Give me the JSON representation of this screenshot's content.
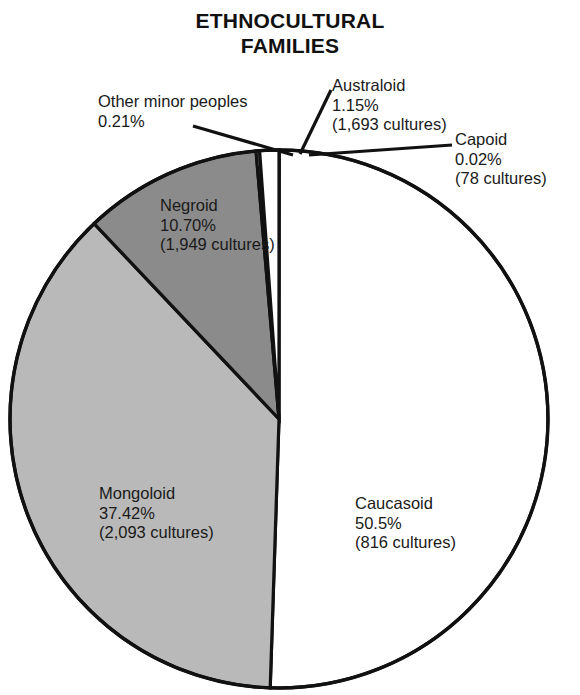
{
  "title": {
    "line1": "ETHNOCULTURAL",
    "line2": "FAMILIES"
  },
  "labels": {
    "other": {
      "name": "Other minor peoples",
      "percent": "0.21%",
      "count": ""
    },
    "australoid": {
      "name": "Australoid",
      "percent": "1.15%",
      "count": "(1,693 cultures)"
    },
    "capoid": {
      "name": "Capoid",
      "percent": "0.02%",
      "count": "(78 cultures)"
    },
    "negroid": {
      "name": "Negroid",
      "percent": "10.70%",
      "count": "(1,949 cultures)"
    },
    "mongoloid": {
      "name": "Mongoloid",
      "percent": "37.42%",
      "count": "(2,093 cultures)"
    },
    "caucasoid": {
      "name": "Caucasoid",
      "percent": "50.5%",
      "count": "(816 cultures)"
    }
  },
  "chart_data": {
    "type": "pie",
    "title": "ETHNOCULTURAL FAMILIES",
    "xlabel": "",
    "ylabel": "",
    "grid": false,
    "legend": "none (direct slice labels with leader lines)",
    "units": "percent of world population; culture counts in parentheses",
    "start_angle_deg": 0,
    "direction": "clockwise from 12 o'clock",
    "categories": [
      "Capoid",
      "Caucasoid",
      "Mongoloid",
      "Negroid",
      "Other minor peoples",
      "Australoid"
    ],
    "values": [
      0.02,
      50.5,
      37.42,
      10.7,
      0.21,
      1.15
    ],
    "counts": [
      78,
      816,
      2093,
      1949,
      null,
      1693
    ],
    "colors": [
      "#ffffff",
      "#ffffff",
      "#b9b9b9",
      "#8b8b8b",
      "#ffffff",
      "#ffffff"
    ],
    "slices": [
      {
        "label": "Capoid",
        "value": 0.02,
        "count": 78,
        "color": "#ffffff",
        "labeled_with_leader": true
      },
      {
        "label": "Caucasoid",
        "value": 50.5,
        "count": 816,
        "color": "#ffffff",
        "labeled_with_leader": false
      },
      {
        "label": "Mongoloid",
        "value": 37.42,
        "count": 2093,
        "color": "#b9b9b9",
        "labeled_with_leader": false
      },
      {
        "label": "Negroid",
        "value": 10.7,
        "count": 1949,
        "color": "#8b8b8b",
        "labeled_with_leader": false
      },
      {
        "label": "Other minor peoples",
        "value": 0.21,
        "count": null,
        "color": "#ffffff",
        "labeled_with_leader": true
      },
      {
        "label": "Australoid",
        "value": 1.15,
        "count": 1693,
        "color": "#ffffff",
        "labeled_with_leader": true
      }
    ]
  }
}
